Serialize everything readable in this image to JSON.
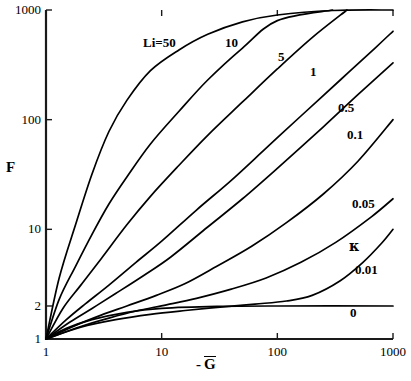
{
  "chart_data": {
    "type": "line",
    "title": "",
    "xlabel": "- Ḡ",
    "ylabel": "F",
    "xscale": "log",
    "yscale": "log",
    "xlim": [
      1,
      1000
    ],
    "ylim": [
      1,
      1000
    ],
    "xticks": [
      1,
      10,
      100,
      1000
    ],
    "xticklabels": [
      "1",
      "10",
      "100",
      "1000"
    ],
    "yticks": [
      1,
      2,
      10,
      100,
      1000
    ],
    "yticklabels": [
      "1",
      "2",
      "10",
      "100",
      "1000"
    ],
    "grid": false,
    "legend": "inline-curve-labels",
    "param_symbol": "κ",
    "series": [
      {
        "name": "Li=50",
        "label": "Li=50",
        "kappa": 50,
        "x": [
          1,
          1.3,
          1.8,
          2.5,
          3.5,
          5,
          8,
          14,
          25,
          50,
          100,
          300,
          1000
        ],
        "y": [
          1,
          3.6,
          11,
          32,
          78,
          150,
          280,
          430,
          600,
          780,
          900,
          990,
          1000
        ]
      },
      {
        "name": "10",
        "label": "10",
        "kappa": 10,
        "x": [
          1,
          1.3,
          1.8,
          2.5,
          3.5,
          5,
          8,
          14,
          25,
          50,
          100,
          300,
          1000
        ],
        "y": [
          1,
          2.3,
          4.6,
          9.0,
          17,
          30,
          60,
          118,
          230,
          450,
          800,
          1000,
          1000
        ]
      },
      {
        "name": "5",
        "label": "5",
        "kappa": 5,
        "x": [
          1,
          1.4,
          2,
          3,
          5,
          8,
          14,
          25,
          50,
          100,
          200,
          400,
          1000
        ],
        "y": [
          1,
          1.9,
          3.1,
          5.4,
          11,
          20,
          38,
          72,
          145,
          290,
          560,
          1000,
          1000
        ]
      },
      {
        "name": "1",
        "label": "1",
        "kappa": 1,
        "x": [
          1,
          1.5,
          2.2,
          3.5,
          6,
          10,
          20,
          40,
          80,
          160,
          350,
          700,
          1000
        ],
        "y": [
          1,
          1.5,
          2.1,
          3.1,
          5.0,
          7.8,
          15,
          28,
          55,
          108,
          230,
          450,
          640
        ]
      },
      {
        "name": "0.5",
        "label": "0.5",
        "kappa": 0.5,
        "x": [
          1,
          1.6,
          2.5,
          4,
          7,
          12,
          25,
          50,
          100,
          250,
          500,
          1000
        ],
        "y": [
          1,
          1.42,
          1.9,
          2.6,
          3.8,
          5.6,
          10.5,
          19,
          36,
          86,
          170,
          330
        ]
      },
      {
        "name": "0.1",
        "label": "0.1",
        "kappa": 0.1,
        "x": [
          1,
          1.8,
          3,
          5,
          9,
          16,
          30,
          60,
          120,
          250,
          500,
          1000
        ],
        "y": [
          1,
          1.33,
          1.65,
          2.0,
          2.5,
          3.2,
          4.6,
          7.0,
          11.5,
          21,
          42,
          100
        ]
      },
      {
        "name": "0.05",
        "label": "0.05",
        "kappa": 0.05,
        "x": [
          1,
          2,
          3.5,
          6,
          11,
          20,
          40,
          80,
          160,
          320,
          650,
          1000
        ],
        "y": [
          1,
          1.3,
          1.55,
          1.8,
          2.05,
          2.35,
          2.85,
          3.6,
          5.0,
          7.6,
          13,
          19
        ]
      },
      {
        "name": "0.01",
        "label": "0.01",
        "kappa": 0.01,
        "x": [
          1,
          2,
          4,
          8,
          16,
          32,
          64,
          120,
          200,
          350,
          550,
          800,
          1000
        ],
        "y": [
          1,
          1.28,
          1.5,
          1.68,
          1.82,
          1.95,
          2.08,
          2.22,
          2.5,
          3.4,
          5.0,
          7.5,
          10
        ]
      },
      {
        "name": "0",
        "label": "0",
        "kappa": 0,
        "x": [
          1,
          1.5,
          2.5,
          5,
          10,
          30,
          100,
          1000
        ],
        "y": [
          1,
          1.25,
          1.5,
          1.75,
          1.9,
          1.98,
          2.0,
          2.0
        ]
      }
    ],
    "annotations": [
      {
        "text": "Li=50",
        "x_px": 143,
        "y_px": 36
      },
      {
        "text": "10",
        "x_px": 225,
        "y_px": 36
      },
      {
        "text": "5",
        "x_px": 278,
        "y_px": 50
      },
      {
        "text": "1",
        "x_px": 310,
        "y_px": 65
      },
      {
        "text": "0.5",
        "x_px": 338,
        "y_px": 101
      },
      {
        "text": "0.1",
        "x_px": 347,
        "y_px": 128
      },
      {
        "text": "0.05",
        "x_px": 352,
        "y_px": 197
      },
      {
        "text": "κ",
        "x_px": 349,
        "y_px": 239
      },
      {
        "text": "0.01",
        "x_px": 355,
        "y_px": 263
      },
      {
        "text": "0",
        "x_px": 350,
        "y_px": 306
      }
    ]
  },
  "axis": {
    "y_label": "F",
    "x_label_prefix": "-",
    "x_label_symbol": "G"
  }
}
